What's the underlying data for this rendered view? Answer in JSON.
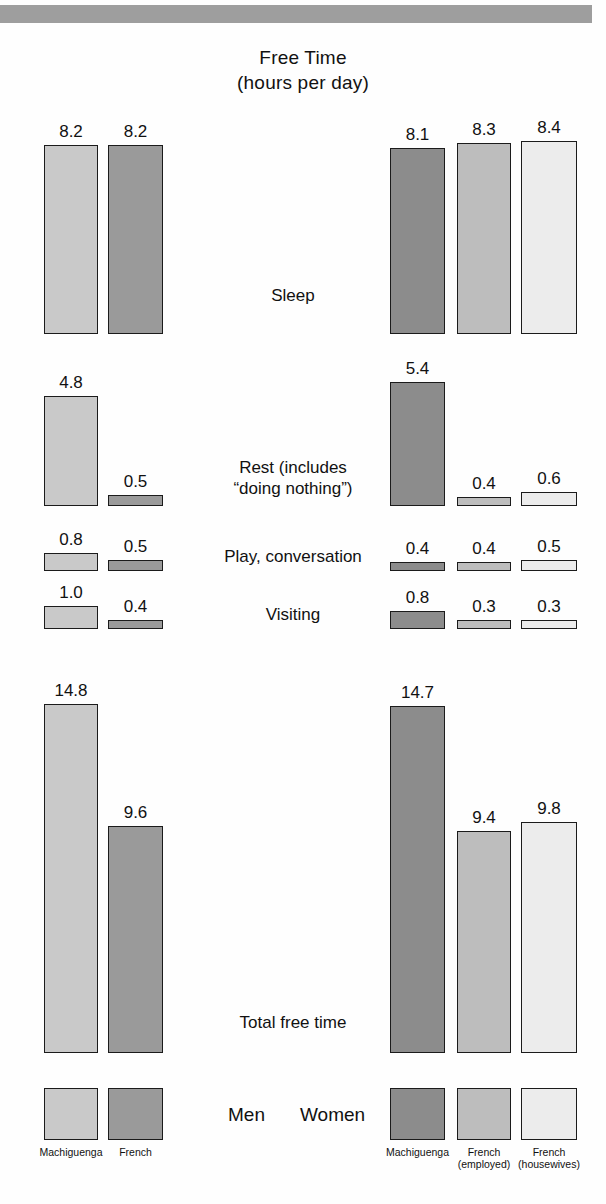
{
  "title": {
    "line1": "Free Time",
    "line2": "(hours per day)"
  },
  "group_labels": {
    "men": "Men",
    "women": "Women"
  },
  "legend": {
    "men": [
      {
        "key": "machiguenga-men",
        "line1": "Machiguenga",
        "line2": "",
        "color": "#c9c9c9"
      },
      {
        "key": "french-men",
        "line1": "French",
        "line2": "",
        "color": "#9a9a9a"
      }
    ],
    "women": [
      {
        "key": "machiguenga-women",
        "line1": "Machiguenga",
        "line2": "",
        "color": "#8c8c8c"
      },
      {
        "key": "french-employed-women",
        "line1": "French",
        "line2": "(employed)",
        "color": "#bdbdbd"
      },
      {
        "key": "french-housewives",
        "line1": "French",
        "line2": "(housewives)",
        "color": "#ececec"
      }
    ]
  },
  "colors": {
    "machiguenga_men": "#c9c9c9",
    "french_men": "#9a9a9a",
    "machiguenga_women": "#8c8c8c",
    "french_employed_women": "#bdbdbd",
    "french_housewives": "#ececec",
    "outline": "#1b1b1b",
    "topbar": "#9e9e9e"
  },
  "chart_data": {
    "type": "bar",
    "title": "Free Time (hours per day)",
    "xlabel": "",
    "ylabel": "hours per day",
    "grid": false,
    "legend_position": "bottom",
    "categories": [
      "Sleep",
      "Rest  (includes \"doing nothing\")",
      "Play, conversation",
      "Visiting",
      "Total free time"
    ],
    "series": [
      {
        "name": "Machiguenga (men)",
        "group": "Men",
        "color": "#c9c9c9",
        "values": [
          8.2,
          4.8,
          0.8,
          1.0,
          14.8
        ]
      },
      {
        "name": "French (men)",
        "group": "Men",
        "color": "#9a9a9a",
        "values": [
          8.2,
          0.5,
          0.5,
          0.4,
          9.6
        ]
      },
      {
        "name": "Machiguenga (women)",
        "group": "Women",
        "color": "#8c8c8c",
        "values": [
          8.1,
          5.4,
          0.4,
          0.8,
          14.7
        ]
      },
      {
        "name": "French employed (women)",
        "group": "Women",
        "color": "#bdbdbd",
        "values": [
          8.3,
          0.4,
          0.4,
          0.3,
          9.4
        ]
      },
      {
        "name": "French housewives (women)",
        "group": "Women",
        "color": "#ececec",
        "values": [
          8.4,
          0.6,
          0.5,
          0.3,
          9.8
        ]
      }
    ]
  },
  "rows": [
    {
      "id": "sleep",
      "label_line1": "Sleep",
      "label_line2": "",
      "men": [
        {
          "value": "8.2",
          "num": 8.2,
          "color": "#c9c9c9"
        },
        {
          "value": "8.2",
          "num": 8.2,
          "color": "#9a9a9a"
        }
      ],
      "women": [
        {
          "value": "8.1",
          "num": 8.1,
          "color": "#8c8c8c"
        },
        {
          "value": "8.3",
          "num": 8.3,
          "color": "#bdbdbd"
        },
        {
          "value": "8.4",
          "num": 8.4,
          "color": "#ececec"
        }
      ]
    },
    {
      "id": "rest",
      "label_line1": "Rest  (includes",
      "label_line2": "“doing nothing”)",
      "men": [
        {
          "value": "4.8",
          "num": 4.8,
          "color": "#c9c9c9"
        },
        {
          "value": "0.5",
          "num": 0.5,
          "color": "#9a9a9a"
        }
      ],
      "women": [
        {
          "value": "5.4",
          "num": 5.4,
          "color": "#8c8c8c"
        },
        {
          "value": "0.4",
          "num": 0.4,
          "color": "#bdbdbd"
        },
        {
          "value": "0.6",
          "num": 0.6,
          "color": "#ececec"
        }
      ]
    },
    {
      "id": "play",
      "label_line1": "Play, conversation",
      "label_line2": "",
      "men": [
        {
          "value": "0.8",
          "num": 0.8,
          "color": "#c9c9c9"
        },
        {
          "value": "0.5",
          "num": 0.5,
          "color": "#9a9a9a"
        }
      ],
      "women": [
        {
          "value": "0.4",
          "num": 0.4,
          "color": "#8c8c8c"
        },
        {
          "value": "0.4",
          "num": 0.4,
          "color": "#bdbdbd"
        },
        {
          "value": "0.5",
          "num": 0.5,
          "color": "#ececec"
        }
      ]
    },
    {
      "id": "visiting",
      "label_line1": "Visiting",
      "label_line2": "",
      "men": [
        {
          "value": "1.0",
          "num": 1.0,
          "color": "#c9c9c9"
        },
        {
          "value": "0.4",
          "num": 0.4,
          "color": "#9a9a9a"
        }
      ],
      "women": [
        {
          "value": "0.8",
          "num": 0.8,
          "color": "#8c8c8c"
        },
        {
          "value": "0.3",
          "num": 0.3,
          "color": "#bdbdbd"
        },
        {
          "value": "0.3",
          "num": 0.3,
          "color": "#ececec"
        }
      ]
    },
    {
      "id": "total",
      "label_line1": "Total free time",
      "label_line2": "",
      "men": [
        {
          "value": "14.8",
          "num": 14.8,
          "color": "#c9c9c9"
        },
        {
          "value": "9.6",
          "num": 9.6,
          "color": "#9a9a9a"
        }
      ],
      "women": [
        {
          "value": "14.7",
          "num": 14.7,
          "color": "#8c8c8c"
        },
        {
          "value": "9.4",
          "num": 9.4,
          "color": "#bdbdbd"
        },
        {
          "value": "9.8",
          "num": 9.8,
          "color": "#ececec"
        }
      ]
    }
  ],
  "layout": {
    "men_bar_x": [
      44,
      108
    ],
    "men_bar_w": [
      54,
      55
    ],
    "women_bar_x": [
      390,
      457,
      521
    ],
    "women_bar_w": [
      55,
      54,
      56
    ],
    "row_baselines": [
      334,
      506,
      571,
      629,
      1053
    ],
    "row_scale": [
      23.0,
      23.0,
      23.0,
      23.0,
      23.6
    ],
    "row_label_centers": [
      295,
      478,
      556,
      614,
      1022
    ],
    "legend_y": 1088,
    "legend_h": 52,
    "legend_text_y": 1146
  }
}
